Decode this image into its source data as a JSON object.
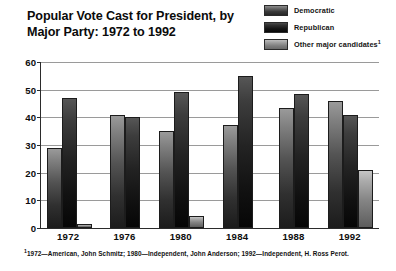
{
  "chart_data": {
    "type": "bar",
    "title": "Popular Vote Cast for President, by Major Party: 1972 to 1992",
    "title_line1": "Popular Vote Cast for President, by",
    "title_line2": "Major Party: 1972 to 1992",
    "xlabel": "",
    "ylabel": "",
    "ylim": [
      0,
      60
    ],
    "yticks": [
      0,
      10,
      20,
      30,
      40,
      50,
      60
    ],
    "grid": true,
    "legend_position": "top-right",
    "categories": [
      "1972",
      "1976",
      "1980",
      "1984",
      "1988",
      "1992"
    ],
    "series": [
      {
        "name": "Democratic",
        "color": "#545454",
        "values": [
          29.0,
          41.0,
          35.0,
          37.3,
          43.5,
          45.8
        ]
      },
      {
        "name": "Republican",
        "color": "#1a1a1a",
        "values": [
          47.0,
          40.3,
          49.2,
          55.0,
          48.6,
          40.7
        ]
      },
      {
        "name": "Other major candidates",
        "color": "#8f8f8f",
        "values": [
          1.4,
          0,
          4.2,
          0,
          0,
          20.8
        ]
      }
    ],
    "footnote": "1972—American, John Schmitz; 1980—Independent, John Anderson; 1992—Independent, H. Ross Perot.",
    "footnote_marker": "1",
    "legend_marker": "1"
  },
  "legend": {
    "items": [
      {
        "label": "Democratic",
        "marker": ""
      },
      {
        "label": "Republican",
        "marker": ""
      },
      {
        "label": "Other major candidates",
        "marker": "1"
      }
    ]
  }
}
